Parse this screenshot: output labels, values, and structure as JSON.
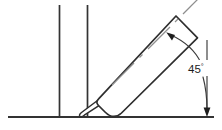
{
  "drawing": {
    "title": "Angled nozzle at 45 degrees to horizontal surface",
    "type": "technical-line-drawing",
    "canvas": {
      "width": 222,
      "height": 130,
      "background": "#ffffff"
    },
    "dimension": {
      "label_value": "45",
      "label_degree_symbol": "°",
      "label_full": "45°",
      "label_x": 188,
      "label_y": 73,
      "arc_style": "curved-double-arrow",
      "arrow_count": 2
    },
    "colors": {
      "outline": "#2e2e2e",
      "structure": "#333333",
      "centerline": "#8e8e8e",
      "dimension": "#3a3a3a",
      "arrowhead": "#1e1e1e",
      "background": "#ffffff",
      "fill": "#ffffff"
    },
    "geometry": {
      "ground_line": {
        "x1": 8,
        "y1": 117,
        "x2": 214,
        "y2": 117
      },
      "wall_line_left": {
        "x1": 59,
        "y1": 5,
        "x2": 59,
        "y2": 117
      },
      "wall_line_right": {
        "x1": 87,
        "y1": 5,
        "x2": 87,
        "y2": 117
      },
      "tool_angle_degrees": 45,
      "tool_body": {
        "tip_end_x": 99,
        "tip_end_y": 101,
        "open_end_x": 176,
        "open_end_y": 17,
        "width": 30
      },
      "nozzle_tip": {
        "x1": 96,
        "y1": 104,
        "x2": 80,
        "y2": 115
      },
      "centerline": {
        "x1": 113,
        "y1": 84,
        "x2": 199,
        "y2": 4
      },
      "arc_start_x": 166,
      "arc_start_y": 33,
      "arc_end_x": 207,
      "arc_end_y": 113,
      "extension_line": {
        "x1": 207,
        "y1": 36,
        "x2": 207,
        "y2": 113
      }
    }
  }
}
